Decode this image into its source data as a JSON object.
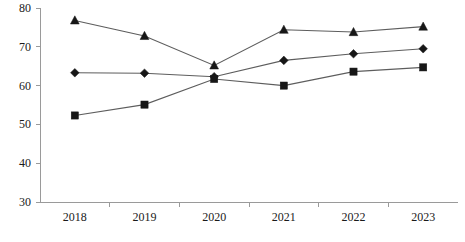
{
  "chart_data": {
    "type": "line",
    "title": "",
    "subtitle": "",
    "xlabel": "",
    "ylabel": "",
    "categories": [
      "2018",
      "2019",
      "2020",
      "2021",
      "2022",
      "2023"
    ],
    "x_tick_labels": [
      "2018",
      "2019",
      "2020",
      "2021",
      "2022",
      "2023"
    ],
    "y_tick_labels": [
      "30",
      "40",
      "50",
      "60",
      "70",
      "80"
    ],
    "y_ticks": [
      30,
      40,
      50,
      60,
      70,
      80
    ],
    "ylim": [
      30,
      80
    ],
    "grid": false,
    "legend": "none",
    "series": [
      {
        "name": "Series 1",
        "marker": "triangle",
        "color": "#171717",
        "values": [
          76.8,
          72.8,
          65.2,
          74.4,
          73.8,
          75.2
        ]
      },
      {
        "name": "Series 2",
        "marker": "diamond",
        "color": "#171717",
        "values": [
          63.3,
          63.2,
          62.3,
          66.5,
          68.2,
          69.5
        ]
      },
      {
        "name": "Series 3",
        "marker": "square",
        "color": "#171717",
        "values": [
          52.3,
          55.1,
          61.7,
          60.0,
          63.6,
          64.7
        ]
      }
    ],
    "line_color": "#5d5d5d",
    "axis_color": "#9a9a9a",
    "background_color": "#ffffff"
  }
}
